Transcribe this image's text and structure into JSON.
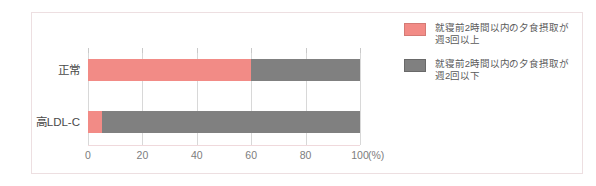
{
  "chart_data": {
    "type": "bar",
    "orientation": "horizontal",
    "stacked": true,
    "normalized_percent": true,
    "title": "",
    "xlabel": "(%)",
    "ylabel": "",
    "xlim": [
      0,
      100
    ],
    "xticks": [
      0,
      20,
      40,
      60,
      80,
      100
    ],
    "xtick_labels": [
      "0",
      "20",
      "40",
      "60",
      "80",
      "100"
    ],
    "grid": true,
    "legend_position": "right",
    "categories": [
      "正常",
      "高LDL-C"
    ],
    "series": [
      {
        "name": "就寝前2時間以内の夕食摂取が\n週3回以上",
        "color": "#f28b86",
        "values": [
          60,
          5
        ]
      },
      {
        "name": "就寝前2時間以内の夕食摂取が\n週2回以下",
        "color": "#808080",
        "values": [
          40,
          95
        ]
      }
    ]
  },
  "axis": {
    "unit_label": "(%)"
  },
  "colors": {
    "series_a": "#f28b86",
    "series_b": "#808080",
    "gridline": "#d8d8d8",
    "frame": "#eddfe1",
    "tick_text": "#7d7d7d",
    "category_text": "#4a4a4a",
    "legend_text": "#5a5a5a"
  }
}
